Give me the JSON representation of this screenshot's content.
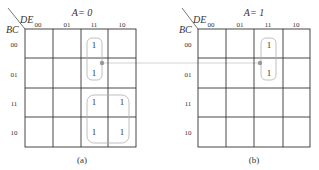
{
  "figure": {
    "connector_color": "#bbbbbb",
    "dot_color": "#999999",
    "grid_color": "#333333",
    "group_color": "#aaaaaa"
  },
  "maps": [
    {
      "id": "a",
      "title": "A= 0",
      "caption": "(a)",
      "row_var": "BC",
      "col_var": "DE",
      "col_labels": [
        "00",
        "01",
        "11",
        "10"
      ],
      "row_labels": [
        "00",
        "01",
        "11",
        "10"
      ],
      "cells": [
        [
          "",
          "",
          "1",
          ""
        ],
        [
          "",
          "",
          "1",
          ""
        ],
        [
          "",
          "",
          "1",
          "1"
        ],
        [
          "",
          "",
          "1",
          "1"
        ]
      ]
    },
    {
      "id": "b",
      "title": "A= 1",
      "caption": "(b)",
      "row_var": "BC",
      "col_var": "DE",
      "col_labels": [
        "00",
        "01",
        "11",
        "10"
      ],
      "row_labels": [
        "00",
        "01",
        "11",
        "10"
      ],
      "cells": [
        [
          "",
          "",
          "1",
          ""
        ],
        [
          "",
          "",
          "1",
          ""
        ],
        [
          "",
          "",
          "",
          ""
        ],
        [
          "",
          "",
          "",
          ""
        ]
      ]
    }
  ]
}
